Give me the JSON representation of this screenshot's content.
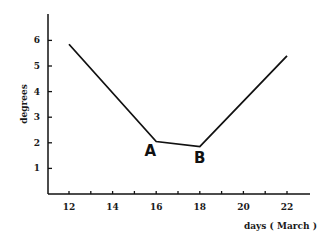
{
  "chart_data": {
    "type": "line",
    "title": "",
    "xlabel": "days ( March )",
    "ylabel": "degrees",
    "x_ticks": [
      12,
      13,
      14,
      15,
      16,
      17,
      18,
      19,
      20,
      21,
      22
    ],
    "x_tick_labels": [
      "12",
      "14",
      "16",
      "18",
      "20",
      "22"
    ],
    "y_tick_labels": [
      "1",
      "2",
      "3",
      "4",
      "5",
      "6"
    ],
    "xlim": [
      11,
      23
    ],
    "ylim": [
      0,
      7
    ],
    "grid": false,
    "legend": null,
    "series": [
      {
        "name": "degrees",
        "x": [
          12,
          16,
          18,
          22
        ],
        "y": [
          5.85,
          2.05,
          1.85,
          5.4
        ],
        "color": "#111111"
      }
    ],
    "annotations": [
      {
        "text": "A",
        "x": 16,
        "y": 2.05
      },
      {
        "text": "B",
        "x": 18,
        "y": 1.85
      }
    ]
  }
}
